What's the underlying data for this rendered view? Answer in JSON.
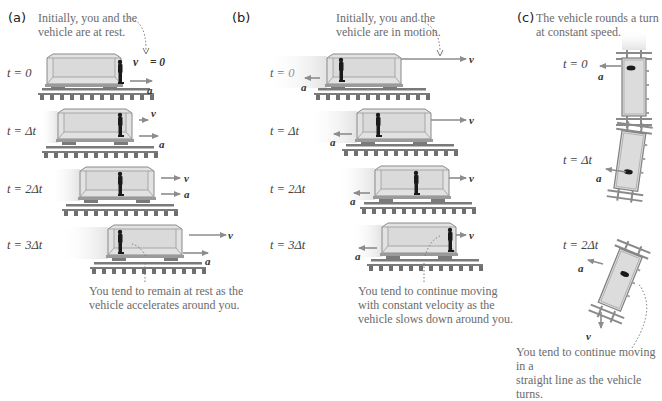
{
  "figure": {
    "panels": [
      {
        "id": "a",
        "label": "(a)",
        "caption_top": [
          "Initially, you and the",
          "vehicle are at rest."
        ],
        "caption_bottom": [
          "You tend to remain at rest as the",
          "vehicle accelerates around you."
        ],
        "time_labels": [
          "t = 0",
          "t = Δt",
          "t = 2Δt",
          "t = 3Δt"
        ],
        "initial_velocity_label": "v = 0",
        "velocity_symbol": "v",
        "acceleration_symbol": "a",
        "acceleration_direction": "right",
        "velocity_direction": "right"
      },
      {
        "id": "b",
        "label": "(b)",
        "caption_top": [
          "Initially, you and the",
          "vehicle are in motion."
        ],
        "caption_bottom": [
          "You tend to continue moving",
          "with constant velocity as the",
          "vehicle slows down around you."
        ],
        "time_labels": [
          "t = 0",
          "t = Δt",
          "t = 2Δt",
          "t = 3Δt"
        ],
        "velocity_symbol": "v",
        "acceleration_symbol": "a",
        "acceleration_direction": "left",
        "velocity_direction": "right"
      },
      {
        "id": "c",
        "label": "(c)",
        "caption_top": [
          "The vehicle rounds a turn",
          "at constant speed."
        ],
        "caption_bottom": [
          "You tend to continue moving in a",
          "straight line as the vehicle turns."
        ],
        "time_labels": [
          "t = 0",
          "t = Δt",
          "t = 2Δt"
        ],
        "velocity_symbol": "v",
        "acceleration_symbol": "a",
        "acceleration_direction": "toward center (left)",
        "velocity_direction": "down"
      }
    ],
    "colors": {
      "vehicle_fill": "#dcdcdc",
      "vehicle_edge": "#8a8a8a",
      "arrow": "#8c8c8c",
      "caption_text": "#6b6b6b",
      "track": "#6f6f6f",
      "person": "#1a1a1a"
    }
  }
}
